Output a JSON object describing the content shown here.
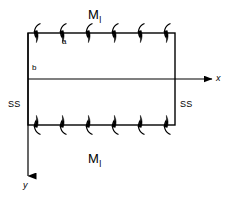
{
  "figure": {
    "type": "engineering-free-body-diagram",
    "stroke_color": "#000000",
    "background_color": "#ffffff"
  },
  "plate": {
    "label": "plate-outline",
    "left": 28,
    "top": 33,
    "right": 175,
    "bottom": 125
  },
  "labels": {
    "moment_top": {
      "symbol": "M",
      "subscript": "l",
      "x": 88,
      "y": 8
    },
    "moment_bottom": {
      "symbol": "M",
      "subscript": "l",
      "x": 88,
      "y": 152
    },
    "dim_a": {
      "text": "a",
      "x": 62,
      "y": 38
    },
    "dim_b": {
      "text": "b",
      "x": 32,
      "y": 64
    },
    "support_left": {
      "text": "SS",
      "x": 8,
      "y": 100
    },
    "support_right": {
      "text": "SS",
      "x": 180,
      "y": 100
    },
    "axis_x": {
      "text": "x",
      "x": 216,
      "y": 79
    },
    "axis_y": {
      "text": "y",
      "x": 23,
      "y": 181
    }
  },
  "axes": {
    "origin": {
      "x": 28,
      "y": 79
    },
    "x_axis": {
      "from_x": 28,
      "to_x": 212,
      "y": 79,
      "direction": "right"
    },
    "y_axis": {
      "x": 28,
      "from_y": 33,
      "to_y": 176,
      "direction": "down"
    }
  },
  "moment_arrows": {
    "count_per_edge": 6,
    "top_edge_y": 33,
    "bottom_edge_y": 125,
    "first_x": 36,
    "spacing": 26,
    "top_sense": "arrowhead-down-left",
    "bottom_sense": "arrowhead-up-left"
  }
}
